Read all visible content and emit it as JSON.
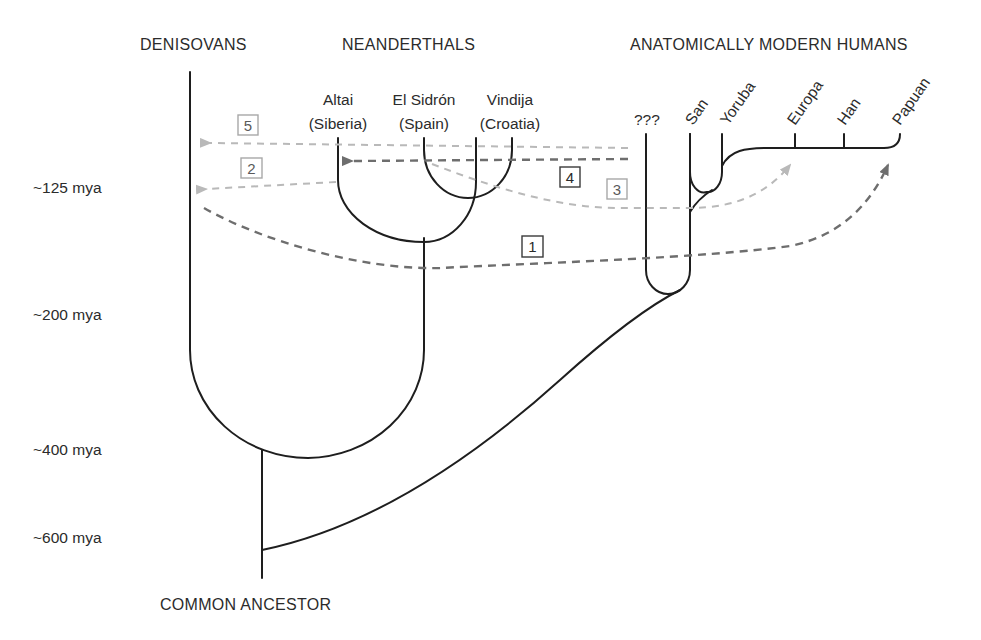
{
  "groups": {
    "denisovans": "DENISOVANS",
    "neanderthals": "NEANDERTHALS",
    "modern_humans": "ANATOMICALLY MODERN HUMANS"
  },
  "neanderthal_leaves": [
    {
      "name": "Altai",
      "region": "(Siberia)"
    },
    {
      "name": "El Sidrón",
      "region": "(Spain)"
    },
    {
      "name": "Vindija",
      "region": "(Croatia)"
    }
  ],
  "human_leaves": [
    "???",
    "San",
    "Yoruba",
    "Europa",
    "Han",
    "Papuan"
  ],
  "root_label": "COMMON ANCESTOR",
  "time_axis": [
    "~125 mya",
    "~200 mya",
    "~400 mya",
    "~600 mya"
  ],
  "gene_flows": [
    {
      "id": "1",
      "style": "dark",
      "from": "Denisovans",
      "to": "Papuan"
    },
    {
      "id": "2",
      "style": "light",
      "from": "Altai",
      "to": "Denisovans"
    },
    {
      "id": "3",
      "style": "light",
      "from": "Neanderthals",
      "to": "Europa"
    },
    {
      "id": "4",
      "style": "dark",
      "from": "???",
      "to": "Altai"
    },
    {
      "id": "5",
      "style": "light",
      "from": "???",
      "to": "Denisovans"
    }
  ],
  "colors": {
    "tree": "#1e1e1e",
    "flow_dark": "#6e6e6e",
    "flow_light": "#b9b9b9"
  }
}
